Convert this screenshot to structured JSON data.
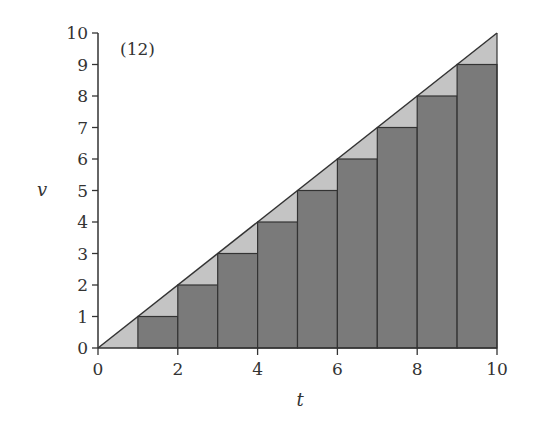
{
  "chart_data": {
    "type": "bar",
    "title": "(12)",
    "xlabel": "t",
    "ylabel": "v",
    "xlim": [
      0,
      10
    ],
    "ylim": [
      0,
      10
    ],
    "x_ticks": [
      0,
      2,
      4,
      6,
      8,
      10
    ],
    "y_ticks": [
      0,
      1,
      2,
      3,
      4,
      5,
      6,
      7,
      8,
      9,
      10
    ],
    "grid": false,
    "legend": null,
    "line": {
      "name": "v = t",
      "x": [
        0,
        10
      ],
      "y": [
        0,
        10
      ]
    },
    "bars": {
      "description": "Left-endpoint rectangles of width 1 under v = t",
      "x_left": [
        0,
        1,
        2,
        3,
        4,
        5,
        6,
        7,
        8,
        9
      ],
      "width": 1,
      "heights": [
        0,
        1,
        2,
        3,
        4,
        5,
        6,
        7,
        8,
        9
      ]
    },
    "colors": {
      "triangle_fill": "#c4c4c4",
      "bar_fill": "#7a7a7a",
      "stroke": "#333333"
    }
  }
}
